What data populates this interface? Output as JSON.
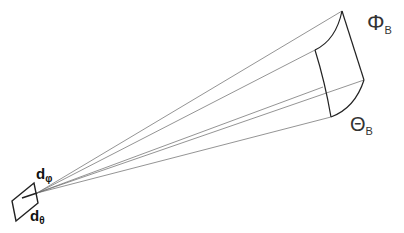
{
  "diagram": {
    "type": "beam solid-angle projection",
    "labels": {
      "phi_beam": {
        "symbol": "Φ",
        "subscript": "B"
      },
      "theta_beam": {
        "symbol": "Θ",
        "subscript": "B"
      },
      "d_phi": {
        "symbol": "d",
        "subscript": "φ"
      },
      "d_theta": {
        "symbol": "d",
        "subscript": "θ"
      }
    },
    "colors": {
      "line": "#222222",
      "ray": "#555555",
      "background": "#ffffff"
    }
  }
}
